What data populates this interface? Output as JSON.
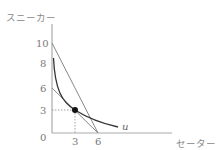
{
  "diagram": {
    "y_axis_label": "スニーカー",
    "x_axis_label": "セーター",
    "origin_label": "0",
    "y_ticks": [
      "10",
      "8",
      "6",
      "3"
    ],
    "x_ticks": [
      "3",
      "6"
    ],
    "curve_label": "u",
    "point": {
      "x": 3,
      "y": 3
    },
    "lines": [
      {
        "name": "steep-budget-line",
        "from": [
          0,
          10
        ],
        "to": [
          6,
          0
        ]
      },
      {
        "name": "shallow-budget-line",
        "from": [
          0,
          6
        ],
        "to": [
          6,
          0
        ]
      }
    ],
    "colors": {
      "axis": "#999999",
      "line": "#888888",
      "curve": "#333333",
      "point": "#111111"
    }
  }
}
